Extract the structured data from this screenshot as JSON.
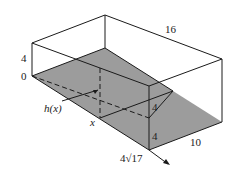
{
  "diagram": {
    "type": "3d-box-with-inclined-plane",
    "labels": {
      "top_length": "16",
      "left_height": "4",
      "origin": "0",
      "function": "h(x)",
      "variable": "x",
      "front_upper": "4",
      "front_lower": "4",
      "right_width": "10",
      "diagonal_length": "4√17"
    },
    "colors": {
      "shaded_plane": "#9c9c9c",
      "edges": "#1a1a1a",
      "background": "#ffffff"
    }
  }
}
